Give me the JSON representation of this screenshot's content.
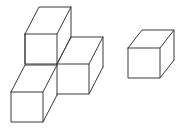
{
  "figure": {
    "description": "Line drawing of a group of four connected unit cubes on the left and a single separate unit cube on the right",
    "background_color": "#ffffff",
    "stroke_color": "#3a3a3a",
    "face_color": "#ffffff",
    "stroke_width": "1",
    "projection": {
      "type": "oblique",
      "front_face_width": 32,
      "front_face_height": 30,
      "group_depth_dx": 14,
      "group_depth_dy": -27,
      "single_depth_dx": 14,
      "single_depth_dy": -18
    },
    "groups": [
      {
        "name": "left-cube-group",
        "cube_count": 4,
        "cubes": [
          {
            "name": "upper-back-cube",
            "front_top_left_x": 25,
            "front_top_left_y": 34,
            "depth_dx": 14,
            "depth_dy": -27
          },
          {
            "name": "middle-right-cube",
            "front_top_left_x": 57,
            "front_top_left_y": 64,
            "depth_dx": 14,
            "depth_dy": -27
          },
          {
            "name": "lower-front-cube",
            "front_top_left_x": 11,
            "front_top_left_y": 92,
            "depth_dx": 14,
            "depth_dy": -27
          },
          {
            "name": "lower-left-riser-cube",
            "front_top_left_x": 25,
            "front_top_left_y": 64,
            "depth_dx": 14,
            "depth_dy": -27
          }
        ]
      },
      {
        "name": "right-single-cube-group",
        "cube_count": 1,
        "cubes": [
          {
            "name": "single-cube",
            "front_top_left_x": 128,
            "front_top_left_y": 48,
            "depth_dx": 14,
            "depth_dy": -18
          }
        ]
      }
    ]
  }
}
